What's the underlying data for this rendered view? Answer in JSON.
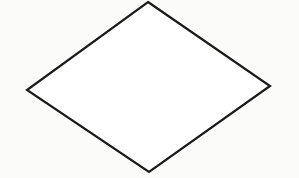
{
  "canvas": {
    "width": 299,
    "height": 178,
    "background_color": "#fbfbfa",
    "description": "Scanned line drawing of a single geometric figure on a plain off-white page"
  },
  "figure": {
    "name": "rhombus",
    "shape_type": "quadrilateral",
    "label": "",
    "fill_color": "#ffffff",
    "stroke_color": "#1c1a19",
    "stroke_width": 2.2,
    "vertices": [
      {
        "name": "top-vertex",
        "x": 148,
        "y": 2
      },
      {
        "name": "right-vertex",
        "x": 270,
        "y": 86
      },
      {
        "name": "bottom-vertex",
        "x": 149,
        "y": 172
      },
      {
        "name": "left-vertex",
        "x": 27,
        "y": 90
      }
    ],
    "points_attr": "148,2 270,86 149,172 27,90"
  }
}
